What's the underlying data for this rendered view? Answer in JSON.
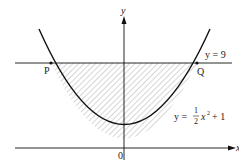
{
  "diagram": {
    "axes": {
      "y_label": "y",
      "x_label": "x",
      "origin_label": "0"
    },
    "points": {
      "P": "P",
      "Q": "Q"
    },
    "line": {
      "label": "y = 9"
    },
    "curve": {
      "label_prefix": "y =",
      "frac_num": "1",
      "frac_den": "2",
      "label_suffix": "x",
      "exponent": "2",
      "label_tail": "+ 1"
    },
    "colors": {
      "stroke": "#111111",
      "hatch": "#777777",
      "background": "#ffffff"
    }
  }
}
